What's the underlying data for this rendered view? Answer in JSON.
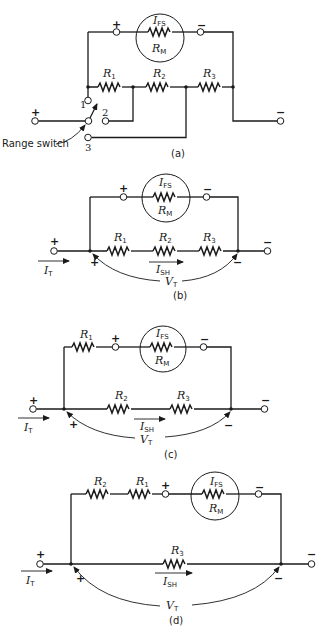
{
  "figures": [
    {
      "caption": "(a)",
      "description": "Ayrton shunt ammeter with range switch",
      "meter": {
        "current_label": "I",
        "current_sub": "FS",
        "resistance_label": "R",
        "resistance_sub": "M"
      },
      "resistors": [
        {
          "label": "R",
          "sub": "1"
        },
        {
          "label": "R",
          "sub": "2"
        },
        {
          "label": "R",
          "sub": "3"
        }
      ],
      "terminals": {
        "plus": "+",
        "minus": "−"
      },
      "switch_positions": [
        "1",
        "2",
        "3"
      ],
      "switch_label": "Range switch"
    },
    {
      "caption": "(b)",
      "description": "Switch in position 1",
      "meter": {
        "current_label": "I",
        "current_sub": "FS",
        "resistance_label": "R",
        "resistance_sub": "M"
      },
      "resistors": [
        {
          "label": "R",
          "sub": "1"
        },
        {
          "label": "R",
          "sub": "2"
        },
        {
          "label": "R",
          "sub": "3"
        }
      ],
      "total_current": {
        "label": "I",
        "sub": "T"
      },
      "shunt_current": {
        "label": "I",
        "sub": "SH"
      },
      "voltage": {
        "label": "V",
        "sub": "T"
      },
      "terminals": {
        "plus": "+",
        "minus": "−"
      }
    },
    {
      "caption": "(c)",
      "description": "Switch in position 2",
      "meter": {
        "current_label": "I",
        "current_sub": "FS",
        "resistance_label": "R",
        "resistance_sub": "M"
      },
      "meter_branch_resistors": [
        {
          "label": "R",
          "sub": "1"
        }
      ],
      "shunt_resistors": [
        {
          "label": "R",
          "sub": "2"
        },
        {
          "label": "R",
          "sub": "3"
        }
      ],
      "total_current": {
        "label": "I",
        "sub": "T"
      },
      "shunt_current": {
        "label": "I",
        "sub": "SH"
      },
      "voltage": {
        "label": "V",
        "sub": "T"
      },
      "terminals": {
        "plus": "+",
        "minus": "−"
      }
    },
    {
      "caption": "(d)",
      "description": "Switch in position 3",
      "meter": {
        "current_label": "I",
        "current_sub": "FS",
        "resistance_label": "R",
        "resistance_sub": "M"
      },
      "meter_branch_resistors": [
        {
          "label": "R",
          "sub": "2"
        },
        {
          "label": "R",
          "sub": "1"
        }
      ],
      "shunt_resistors": [
        {
          "label": "R",
          "sub": "3"
        }
      ],
      "total_current": {
        "label": "I",
        "sub": "T"
      },
      "shunt_current": {
        "label": "I",
        "sub": "SH"
      },
      "voltage": {
        "label": "V",
        "sub": "T"
      },
      "terminals": {
        "plus": "+",
        "minus": "−"
      }
    }
  ]
}
